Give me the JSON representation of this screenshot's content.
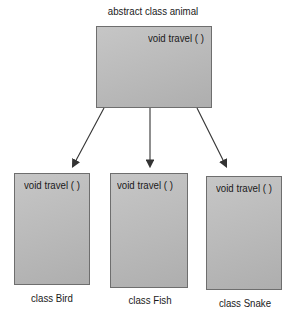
{
  "diagram": {
    "parent": {
      "title": "abstract class animal",
      "method": "void  travel ( )"
    },
    "children": [
      {
        "title": "class Bird",
        "method": "void  travel ( )"
      },
      {
        "title": "class Fish",
        "method": "void  travel ( )"
      },
      {
        "title": "class Snake",
        "method": "void  travel ( )"
      }
    ],
    "colors": {
      "box_fill": "#bcbcbc",
      "box_border": "#6e6e6e",
      "arrow": "#333333"
    }
  }
}
